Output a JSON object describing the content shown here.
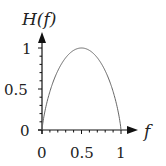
{
  "chart_data": {
    "type": "line",
    "title": "",
    "xlabel": "f",
    "ylabel": "H(f)",
    "xlim": [
      0,
      1
    ],
    "ylim": [
      0,
      1
    ],
    "xticks": [
      "0",
      "0.5",
      "1"
    ],
    "yticks": [
      "0",
      "0.5",
      "1"
    ],
    "grid": false,
    "legend": null,
    "series": [
      {
        "name": "H(f)",
        "description": "binary entropy function H(f) = -f log2 f - (1-f) log2(1-f)",
        "x": [
          0,
          0.05,
          0.1,
          0.15,
          0.2,
          0.25,
          0.3,
          0.35,
          0.4,
          0.45,
          0.5,
          0.55,
          0.6,
          0.65,
          0.7,
          0.75,
          0.8,
          0.85,
          0.9,
          0.95,
          1
        ],
        "values": [
          0,
          0.286,
          0.469,
          0.61,
          0.722,
          0.811,
          0.881,
          0.934,
          0.971,
          0.993,
          1.0,
          0.993,
          0.971,
          0.934,
          0.881,
          0.811,
          0.722,
          0.61,
          0.469,
          0.286,
          0
        ]
      }
    ]
  },
  "labels": {
    "ylabel": "H(f)",
    "xlabel": "f",
    "x0": "0",
    "x05": "0.5",
    "x1": "1",
    "y0": "0",
    "y05": "0.5",
    "y1": "1"
  },
  "colors": {
    "axis": "#111111",
    "curve": "#666666"
  }
}
